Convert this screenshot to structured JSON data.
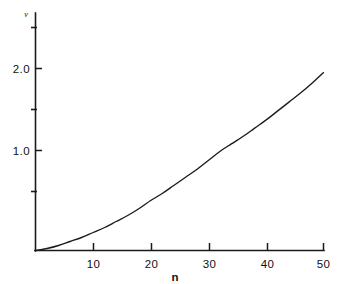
{
  "chart_data": {
    "type": "line",
    "title": "",
    "xlabel": "n",
    "ylabel": "ν",
    "xlim": [
      0,
      52
    ],
    "ylim": [
      0,
      2.6
    ],
    "grid": false,
    "legend": null,
    "x_ticks": [
      10,
      20,
      30,
      40,
      50
    ],
    "x_tick_labels": [
      "10",
      "20",
      "30",
      "40",
      "50"
    ],
    "y_ticks": [
      1.0,
      2.0
    ],
    "y_tick_labels": [
      "1.0",
      "2.0"
    ],
    "y_minor_ticks": [
      0.5,
      1.5,
      2.5
    ],
    "series": [
      {
        "name": "nu",
        "x": [
          0,
          2,
          4,
          6,
          8,
          10,
          12,
          14,
          16,
          18,
          20,
          22,
          24,
          26,
          28,
          30,
          32,
          34,
          36,
          38,
          40,
          42,
          44,
          46,
          48,
          50
        ],
        "y": [
          0.0,
          0.02,
          0.05,
          0.09,
          0.13,
          0.18,
          0.23,
          0.29,
          0.35,
          0.42,
          0.5,
          0.57,
          0.65,
          0.73,
          0.81,
          0.9,
          0.99,
          1.08,
          1.17,
          1.27,
          1.37,
          1.48,
          1.59,
          1.7,
          1.82,
          1.95
        ]
      }
    ]
  },
  "axis": {
    "x_label": "n",
    "y_label": "ν",
    "x_tick_labels": [
      "10",
      "20",
      "30",
      "40",
      "50"
    ],
    "y_tick_labels": [
      "1.0",
      "2.0"
    ]
  },
  "colors": {
    "background": "#ffffff",
    "axis": "#1a1a1a",
    "curve": "#1a1a1a",
    "text": "#111111"
  }
}
